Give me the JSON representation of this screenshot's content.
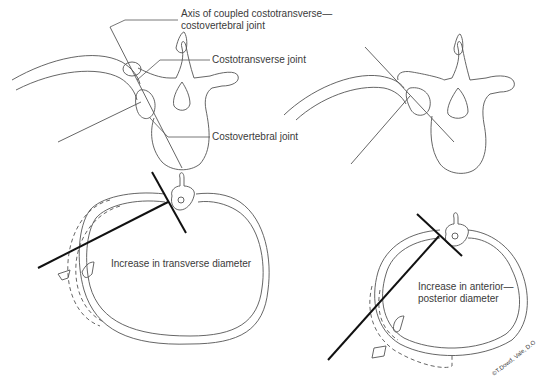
{
  "figure": {
    "top_left": {
      "labels": {
        "axis": [
          "Axis of coupled costotransverse—",
          "costovertebral joint"
        ],
        "costotransverse": "Costotransverse joint",
        "costovertebral": "Costovertebral joint"
      }
    },
    "top_right": {},
    "bottom_left": {
      "caption": "Increase in transverse diameter"
    },
    "bottom_right": {
      "caption": [
        "Increase in anterior—",
        "posterior diameter"
      ]
    },
    "signature": "©T.Dowd, Vale, D.O"
  },
  "colors": {
    "line": "#555555",
    "axis_line": "#111111",
    "text": "#3a3a3a",
    "background": "#ffffff"
  }
}
